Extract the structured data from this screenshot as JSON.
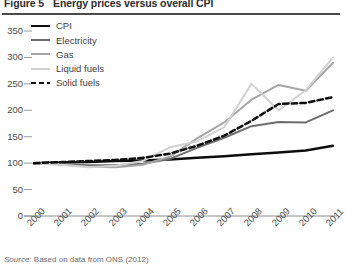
{
  "figure": {
    "number_label": "Figure 5",
    "title": "Energy prices versus overall CPI",
    "source_lead": "Source:",
    "source_text": "Based on data from ONS (2012)"
  },
  "legend": {
    "position": "top-left",
    "items": [
      {
        "label": "CPI",
        "style": "solid",
        "color": "#0d0d0d",
        "width": 2.6
      },
      {
        "label": "Electricity",
        "style": "solid",
        "color": "#6e6e6e",
        "width": 2.0
      },
      {
        "label": "Gas",
        "style": "solid",
        "color": "#a6a6a6",
        "width": 2.0
      },
      {
        "label": "Liquid fuels",
        "style": "solid",
        "color": "#d2d2d2",
        "width": 2.0
      },
      {
        "label": "Solid fuels",
        "style": "dashed",
        "color": "#0d0d0d",
        "width": 2.6
      }
    ]
  },
  "chart_data": {
    "type": "line",
    "title": "Energy prices versus overall CPI",
    "xlabel": "",
    "ylabel": "",
    "ylim": [
      0,
      350
    ],
    "yticks": [
      0,
      50,
      100,
      150,
      200,
      250,
      300,
      350
    ],
    "grid": false,
    "legend_position": "top-left",
    "x": [
      2000,
      2001,
      2002,
      2003,
      2004,
      2005,
      2006,
      2007,
      2008,
      2009,
      2010,
      2011
    ],
    "categories": [
      "2000",
      "2001",
      "2002",
      "2003",
      "2004",
      "2005",
      "2006",
      "2007",
      "2008",
      "2009",
      "2010",
      "2011"
    ],
    "series": [
      {
        "name": "CPI",
        "color": "#0d0d0d",
        "style": "solid",
        "values": [
          100,
          101,
          102,
          104,
          105,
          107,
          110,
          113,
          117,
          120,
          124,
          133
        ]
      },
      {
        "name": "Electricity",
        "color": "#6e6e6e",
        "style": "solid",
        "values": [
          100,
          98,
          96,
          96,
          99,
          108,
          129,
          148,
          170,
          178,
          177,
          200
        ]
      },
      {
        "name": "Gas",
        "color": "#a6a6a6",
        "style": "solid",
        "values": [
          100,
          97,
          93,
          92,
          97,
          112,
          147,
          177,
          220,
          248,
          237,
          290
        ]
      },
      {
        "name": "Liquid fuels",
        "color": "#d2d2d2",
        "style": "solid",
        "values": [
          100,
          97,
          92,
          95,
          104,
          130,
          141,
          168,
          250,
          200,
          238,
          300
        ]
      },
      {
        "name": "Solid fuels",
        "color": "#0d0d0d",
        "style": "dashed",
        "values": [
          100,
          102,
          104,
          106,
          110,
          118,
          133,
          152,
          180,
          212,
          214,
          225
        ]
      }
    ]
  }
}
